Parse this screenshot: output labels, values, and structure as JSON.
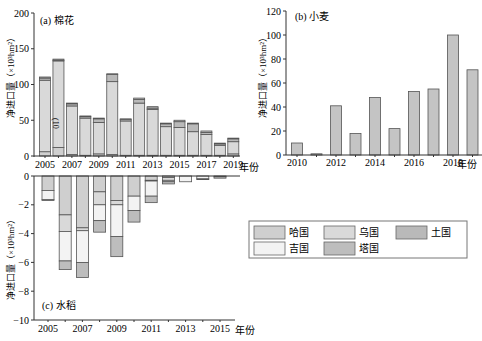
{
  "colors": {
    "kazakhstan": "#cfcfcf",
    "uzbekistan": "#d9d9d9",
    "turkmenistan": "#b9b9b9",
    "kyrgyzstan": "#f3f3f3",
    "tajikistan": "#bdbdbd",
    "wheat_bar": "#c4c4c4",
    "axis": "#333333",
    "outline": "#555555"
  },
  "legend": {
    "items": [
      {
        "key": "kazakhstan",
        "label": "哈国"
      },
      {
        "key": "uzbekistan",
        "label": "乌国"
      },
      {
        "key": "turkmenistan",
        "label": "土国"
      },
      {
        "key": "kyrgyzstan",
        "label": "吉国"
      },
      {
        "key": "tajikistan",
        "label": "塔国"
      }
    ]
  },
  "chart_data": [
    {
      "id": "a",
      "type": "bar",
      "stacked": true,
      "title": "(a) 棉花",
      "annotation": "(10",
      "xlabel": "年份",
      "ylabel": "净进口量（×10³hm²）",
      "ylim": [
        0,
        200
      ],
      "yticks": [
        0,
        50,
        100,
        150,
        200
      ],
      "xtick_labels": [
        "2005",
        "2007",
        "2009",
        "2011",
        "2013",
        "2015",
        "2017",
        "2019"
      ],
      "categories": [
        "2005",
        "2006",
        "2007",
        "2008",
        "2009",
        "2010",
        "2011",
        "2012",
        "2013",
        "2014",
        "2015",
        "2016",
        "2017",
        "2018",
        "2019"
      ],
      "series": [
        {
          "name": "哈国",
          "key": "kazakhstan",
          "values": [
            6,
            12,
            2,
            1,
            3,
            2,
            1,
            1,
            1,
            1,
            1,
            1,
            1,
            1,
            3
          ]
        },
        {
          "name": "乌国",
          "key": "uzbekistan",
          "values": [
            100,
            121,
            68,
            52,
            44,
            102,
            48,
            73,
            64,
            40,
            39,
            33,
            29,
            14,
            17
          ]
        },
        {
          "name": "土国",
          "key": "turkmenistan",
          "values": [
            3,
            1,
            3,
            2,
            5,
            10,
            2,
            5,
            2,
            4,
            8,
            11,
            3,
            2,
            4
          ]
        },
        {
          "name": "吉国",
          "key": "kyrgyzstan",
          "values": [
            0,
            0,
            0,
            0,
            0,
            0,
            0,
            0,
            0,
            0,
            0,
            0,
            0,
            0,
            0
          ]
        },
        {
          "name": "塔国",
          "key": "tajikistan",
          "values": [
            1.5,
            1.5,
            1,
            1,
            1,
            1,
            1,
            2,
            2,
            1,
            2,
            1,
            2,
            1,
            1
          ]
        }
      ]
    },
    {
      "id": "b",
      "type": "bar",
      "title": "(b) 小麦",
      "xlabel": "年份",
      "ylabel": "净进口量（×10³hm²）",
      "ylim": [
        0,
        120
      ],
      "yticks": [
        0,
        20,
        40,
        60,
        80,
        100,
        120
      ],
      "xtick_labels": [
        "2010",
        "2012",
        "2014",
        "2016",
        "2018"
      ],
      "categories": [
        "2010",
        "2011",
        "2012",
        "2013",
        "2014",
        "2015",
        "2016",
        "2017",
        "2018",
        "2019"
      ],
      "values": [
        10,
        1,
        41,
        18,
        48,
        22,
        53,
        55,
        100,
        71
      ]
    },
    {
      "id": "c",
      "type": "bar",
      "stacked": true,
      "title": "(c) 水稻",
      "xlabel": "年份",
      "ylabel": "净进口量（×10³hm²）",
      "ylim": [
        -10,
        0
      ],
      "yticks": [
        0,
        -2,
        -4,
        -6,
        -8,
        -10
      ],
      "xtick_labels": [
        "2005",
        "2007",
        "2009",
        "2011",
        "2013",
        "2015"
      ],
      "categories": [
        "2005",
        "2006",
        "2007",
        "2008",
        "2009",
        "2010",
        "2011",
        "2012",
        "2013",
        "2014",
        "2015"
      ],
      "series": [
        {
          "name": "哈国",
          "key": "kazakhstan",
          "values": [
            -1.0,
            -2.7,
            -3.6,
            -1.1,
            -1.7,
            -1.4,
            -0.3,
            -0.1,
            0,
            0,
            -0.05
          ]
        },
        {
          "name": "乌国",
          "key": "uzbekistan",
          "values": [
            0,
            -1.15,
            -0.2,
            -0.9,
            -0.3,
            0,
            -0.05,
            -0.2,
            0,
            0,
            0
          ]
        },
        {
          "name": "吉国",
          "key": "kyrgyzstan",
          "values": [
            -0.65,
            -2.05,
            -2.2,
            -1.1,
            -2.2,
            -1.0,
            -1.05,
            -0.1,
            -0.4,
            -0.2,
            0
          ]
        },
        {
          "name": "塔国",
          "key": "tajikistan",
          "values": [
            -0.05,
            -0.6,
            -1.05,
            -0.8,
            -1.4,
            -0.8,
            -0.45,
            -0.15,
            0,
            -0.05,
            -0.1
          ]
        }
      ]
    }
  ]
}
